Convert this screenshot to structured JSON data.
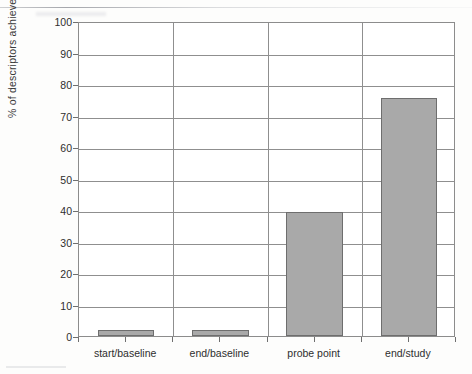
{
  "chart_data": {
    "type": "bar",
    "title": "",
    "xlabel": "",
    "ylabel": "% of descriptors achieved",
    "categories": [
      "start/baseline",
      "end/baseline",
      "probe point",
      "end/study"
    ],
    "values": [
      2,
      2,
      39.5,
      75.7
    ],
    "ylim": [
      0,
      100
    ],
    "yticks": [
      0,
      10,
      20,
      30,
      40,
      50,
      60,
      70,
      80,
      90,
      100
    ],
    "ytick_labels": [
      "0",
      "10",
      "20",
      "30",
      "40",
      "50",
      "60",
      "70",
      "80",
      "90",
      "100"
    ],
    "grid": "horizontal-and-vertical",
    "legend": "none",
    "bar_color": "#a9a9a9",
    "bar_border_color": "#6e6e6e",
    "axis_color": "#8c8c8c",
    "plot_background": "#ffffff",
    "page_background": "#fdfdfc"
  }
}
